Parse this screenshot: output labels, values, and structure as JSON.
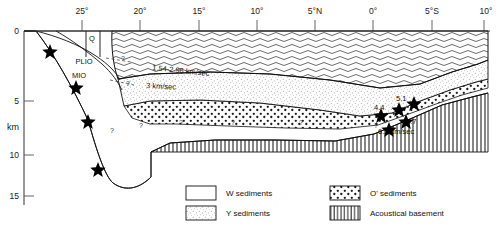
{
  "figure": {
    "type": "geologic-cross-section",
    "x_axis": {
      "label": "",
      "ticks": [
        "25°",
        "20°",
        "15°",
        "10°",
        "5°N",
        "0°",
        "5°S",
        "10°"
      ],
      "tick_x": [
        82,
        140,
        199,
        257,
        315,
        373,
        432,
        480
      ]
    },
    "y_axis": {
      "unit": "km",
      "ticks": [
        "0",
        "5",
        "10",
        "15"
      ],
      "tick_y": [
        31,
        101,
        155,
        196
      ]
    },
    "strat_labels": [
      {
        "text": "Q",
        "x": 92,
        "y": 41
      },
      {
        "text": "PLIO",
        "x": 84,
        "y": 62
      },
      {
        "text": "MIO",
        "x": 79,
        "y": 76
      }
    ],
    "velocity_labels": [
      {
        "text": "1.54-2.96 km/sec",
        "x": 152,
        "y": 70
      },
      {
        "text": "3 km/sec",
        "x": 146,
        "y": 86
      },
      {
        "text": "4.4",
        "x": 385,
        "y": 107
      },
      {
        "text": "5.1",
        "x": 404,
        "y": 101
      },
      {
        "text": "6.7",
        "x": 412,
        "y": 122
      },
      {
        "text": "6.2  km/sec",
        "x": 395,
        "y": 131
      }
    ],
    "query_marks": [
      {
        "x": 121,
        "y": 61
      },
      {
        "x": 126,
        "y": 84
      },
      {
        "x": 112,
        "y": 132
      },
      {
        "x": 141,
        "y": 127
      },
      {
        "x": 180,
        "y": 124
      },
      {
        "x": 232,
        "y": 124
      },
      {
        "x": 300,
        "y": 124
      },
      {
        "x": 376,
        "y": 127
      }
    ],
    "stars": [
      {
        "x": 50,
        "y": 50
      },
      {
        "x": 76,
        "y": 86
      },
      {
        "x": 88,
        "y": 120
      },
      {
        "x": 98,
        "y": 168
      },
      {
        "x": 381,
        "y": 114
      },
      {
        "x": 399,
        "y": 108
      },
      {
        "x": 414,
        "y": 102
      },
      {
        "x": 406,
        "y": 120
      },
      {
        "x": 389,
        "y": 128
      }
    ]
  },
  "legend": {
    "items": [
      {
        "label": "W sediments",
        "pattern": "blank"
      },
      {
        "label": "O' sediments",
        "pattern": "coarse-dots"
      },
      {
        "label": "Y sediments",
        "pattern": "fine-stipple"
      },
      {
        "label": "Acoustical basement",
        "pattern": "vertical-lines"
      }
    ]
  },
  "colors": {
    "ink": "#111111",
    "background": "#ffffff",
    "pattern": "#333333"
  }
}
